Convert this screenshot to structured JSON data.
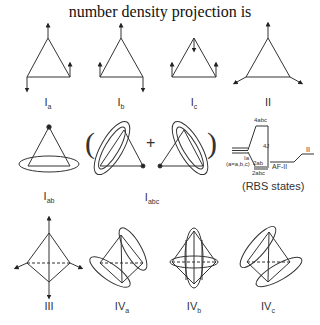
{
  "title": "number density projection is",
  "labels": {
    "Ia": {
      "main": "I",
      "sub": "a"
    },
    "Ib": {
      "main": "I",
      "sub": "b"
    },
    "Ic": {
      "main": "I",
      "sub": "c"
    },
    "II": {
      "main": "II",
      "sub": ""
    },
    "Iab": {
      "main": "I",
      "sub": "ab"
    },
    "Iabc": {
      "main": "I",
      "sub": "abc"
    },
    "III": {
      "main": "III",
      "sub": ""
    },
    "IVa": {
      "main": "IV",
      "sub": "a"
    },
    "IVb": {
      "main": "IV",
      "sub": "b"
    },
    "IVc": {
      "main": "IV",
      "sub": "c"
    }
  },
  "energy_diagram": {
    "top_level": "4abc",
    "gap": "4J",
    "left_level": "Ia",
    "left_note": "(a=a,b,c)",
    "level_2ab": "2ab",
    "level_2abc": "2abc",
    "afii": "AF-II",
    "right_level": "II",
    "caption": "(RBS states)"
  },
  "operators": {
    "open": "(",
    "plus": "+",
    "close": ")"
  }
}
